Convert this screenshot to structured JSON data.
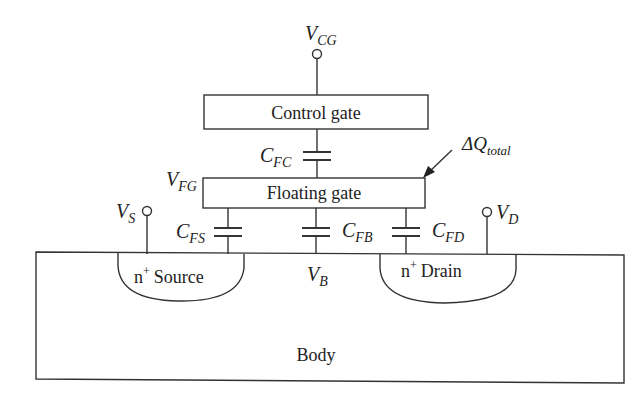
{
  "diagram": {
    "nodes": {
      "control_gate": "Control gate",
      "floating_gate": "Floating gate",
      "source": "Source",
      "drain": "Drain",
      "body": "Body",
      "n_plus": "n",
      "plus": "+"
    },
    "voltages": {
      "vcg": {
        "main": "V",
        "sub": "CG"
      },
      "vfg": {
        "main": "V",
        "sub": "FG"
      },
      "vs": {
        "main": "V",
        "sub": "S"
      },
      "vd": {
        "main": "V",
        "sub": "D"
      },
      "vb": {
        "main": "V",
        "sub": "B"
      }
    },
    "capacitors": {
      "cfc": {
        "main": "C",
        "sub": "FC"
      },
      "cfs": {
        "main": "C",
        "sub": "FS"
      },
      "cfb": {
        "main": "C",
        "sub": "FB"
      },
      "cfd": {
        "main": "C",
        "sub": "FD"
      }
    },
    "charge": {
      "main": "ΔQ",
      "sub": "total"
    }
  }
}
